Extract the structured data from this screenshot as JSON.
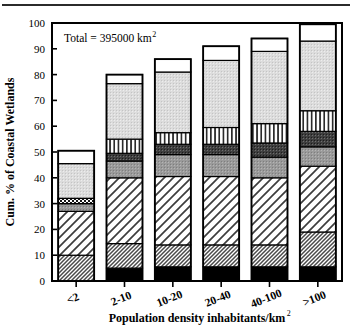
{
  "chart_data": {
    "type": "bar",
    "subtype": "stacked-bar",
    "title": "",
    "annotation": "Total =  395000 km",
    "annotation_sup": "2",
    "xlabel": "Population density inhabitants/km",
    "xlabel_sup": "2",
    "ylabel": "Cum. % of Coastal Wetlands",
    "ylim": [
      0,
      100
    ],
    "yticks": [
      0,
      10,
      20,
      30,
      40,
      50,
      60,
      70,
      80,
      90,
      100
    ],
    "ytick_labels": [
      "0",
      "10",
      "20",
      "30",
      "40",
      "50",
      "60",
      "70",
      "80",
      "90",
      "100"
    ],
    "grid": false,
    "legend": "none",
    "categories": [
      "<2",
      "2-10",
      "10-20",
      "20-40",
      "40-100",
      ">100"
    ],
    "series": [
      {
        "name": "solid-black",
        "fill": "black",
        "values": [
          0,
          5,
          5.5,
          5.5,
          5.5,
          5.5
        ]
      },
      {
        "name": "dense-crosshatch",
        "fill": "dense",
        "values": [
          10,
          9.5,
          8.5,
          8.5,
          8.5,
          13.5
        ]
      },
      {
        "name": "diagonal-hatch",
        "fill": "diag",
        "values": [
          17,
          25.5,
          26.5,
          26.5,
          26,
          25.5
        ]
      },
      {
        "name": "medium-gray",
        "fill": "gray",
        "values": [
          3,
          6.5,
          8.5,
          8.5,
          8,
          7.5
        ]
      },
      {
        "name": "dark-gray-speckle",
        "fill": "dark",
        "values": [
          0,
          3,
          4,
          4,
          5.5,
          6
        ]
      },
      {
        "name": "vertical-stripe",
        "fill": "vert",
        "values": [
          2,
          5.5,
          4.5,
          6.5,
          7.5,
          8
        ]
      },
      {
        "name": "light-gray",
        "fill": "light",
        "values": [
          13.5,
          21.5,
          23.5,
          26,
          28,
          27
        ]
      },
      {
        "name": "white",
        "fill": "white",
        "values": [
          5,
          3.5,
          5,
          5.5,
          5,
          6.5
        ]
      }
    ],
    "cumulative_tops": {
      "<2": [
        10,
        10,
        27,
        30,
        30,
        32,
        45.5,
        50.5
      ],
      "2-10": [
        5,
        14.5,
        40,
        46.5,
        49.5,
        55,
        76.5,
        80
      ],
      "10-20": [
        5.5,
        14,
        40.5,
        49,
        53,
        57.5,
        81,
        86
      ],
      "20-40": [
        5.5,
        14,
        40.5,
        49,
        53,
        59.5,
        85.5,
        91
      ],
      "40-100": [
        5.5,
        14,
        40,
        48,
        53.5,
        61,
        89,
        94
      ],
      ">100": [
        5.5,
        19,
        44.5,
        52,
        58,
        66,
        93,
        99.5
      ]
    },
    "bar_totals": [
      50.5,
      80,
      86,
      91,
      94,
      99.5
    ]
  },
  "colors": {
    "axis": "#000000",
    "black_segment": "#000000",
    "gray_segment": "#9a9a9a",
    "dark_segment": "#3f3f3f",
    "light_segment": "#d8d8d8",
    "white_segment": "#ffffff",
    "background": "#ffffff"
  }
}
